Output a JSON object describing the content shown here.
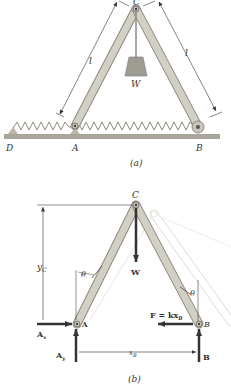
{
  "figure_a": {
    "caption": "(a)",
    "points": {
      "C": "C",
      "D": "D",
      "A": "A",
      "B": "B"
    },
    "weight_label": "W",
    "length_label_left": "l",
    "length_label_right": "l"
  },
  "figure_b": {
    "caption": "(b)",
    "points": {
      "C": "C",
      "A": "A",
      "B": "B"
    },
    "labels": {
      "yC_main": "y",
      "yC_sub": "C",
      "theta_left": "θ",
      "theta_right": "θ",
      "W": "W",
      "F": "F = kx",
      "F_sub": "B",
      "Ax_main": "A",
      "Ax_sub": "x",
      "Ay_main": "A",
      "Ay_sub": "y",
      "xB_main": "x",
      "xB_sub": "B",
      "B_force": "B"
    }
  },
  "colors": {
    "bar_fill": "#d2cfc4",
    "bar_stroke": "#8d897c",
    "ground": "#a9a59a",
    "arrow": "#3a3a3a",
    "ghost": "#e6e4df"
  }
}
